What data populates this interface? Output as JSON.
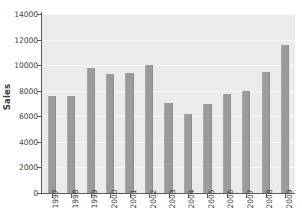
{
  "chart_data": {
    "type": "bar",
    "title": "",
    "subtitle": "",
    "xlabel": "",
    "ylabel": "Sales",
    "categories": [
      "1997",
      "1998",
      "1999",
      "2000",
      "2001",
      "2002",
      "2003",
      "2004",
      "2005",
      "2006",
      "2007",
      "2008",
      "2009"
    ],
    "values": [
      7550,
      7600,
      9750,
      9300,
      9400,
      10050,
      7050,
      6200,
      6950,
      7750,
      7950,
      9500,
      11600
    ],
    "ylim": [
      0,
      14000
    ],
    "y_ticks": [
      0,
      2000,
      4000,
      6000,
      8000,
      10000,
      12000,
      14000
    ],
    "y_tick_labels": [
      "0",
      "2000",
      "4000",
      "6000",
      "8000",
      "10000",
      "12000",
      "14000"
    ],
    "grid": "horizontal-white-on-gray-panel",
    "legend": "none",
    "orientation": "vertical",
    "bar_color": "#9b9b9b",
    "panel_color": "#ebebeb",
    "gridline_color": "#f8f8f8",
    "axis_color": "#5a5a5a",
    "text_color": "#3f3f3f"
  }
}
